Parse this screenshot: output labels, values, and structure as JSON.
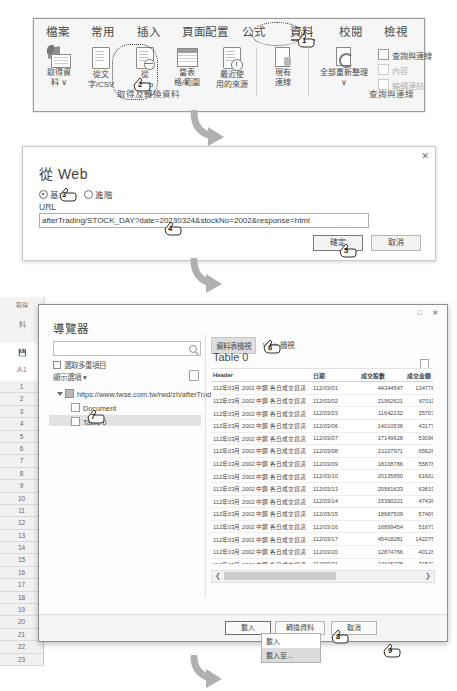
{
  "ribbon": {
    "tabs": [
      {
        "label": "檔案",
        "active": false
      },
      {
        "label": "常用",
        "active": false
      },
      {
        "label": "插入",
        "active": false
      },
      {
        "label": "頁面配置",
        "active": false
      },
      {
        "label": "公式",
        "active": false
      },
      {
        "label": "資料",
        "active": true
      },
      {
        "label": "校閱",
        "active": false
      },
      {
        "label": "檢視",
        "active": false
      }
    ],
    "groups": [
      {
        "label": "取得及轉換資料"
      },
      {
        "label": "查詢與連線"
      }
    ],
    "items": [
      {
        "name": "get-data",
        "line1": "取得資",
        "line2": "料 ∨"
      },
      {
        "name": "from-text-csv",
        "line1": "從文",
        "line2": "字/CSV"
      },
      {
        "name": "from-web",
        "line1": "從",
        "line2": "Web"
      },
      {
        "name": "from-table-range",
        "line1": "當表",
        "line2": "格/範圍"
      },
      {
        "name": "recent-sources",
        "line1": "最近使",
        "line2": "用的來源"
      },
      {
        "name": "existing-connections",
        "line1": "現有",
        "line2": "連線"
      }
    ],
    "refresh_all": {
      "line1": "全部重新整理",
      "line2": "∨"
    },
    "queries_panel": [
      {
        "label": "查詢與連線",
        "disabled": false
      },
      {
        "label": "內容",
        "disabled": true
      },
      {
        "label": "編輯連結",
        "disabled": true
      }
    ]
  },
  "from_web_dialog": {
    "title": "從 Web",
    "radio_basic": "基本",
    "radio_advanced": "進階",
    "url_label": "URL",
    "url_value": "afterTrading/STOCK_DAY?date=20230324&stockNo=2002&response=html",
    "ok_label": "確定",
    "cancel_label": "取消",
    "close_icon": "✕"
  },
  "navigator": {
    "title": "導覽器",
    "maximize_icon": "□",
    "close_icon": "✕",
    "search_placeholder": "",
    "multi_select_label": "選取多重項目",
    "display_options_label": "顯示選項 ▾",
    "tree": [
      {
        "label": "https://www.twse.com.tw/rwd/zh/afterTrading...",
        "level": 0,
        "type": "web",
        "selected": false
      },
      {
        "label": "Document",
        "level": 1,
        "type": "doc",
        "selected": false
      },
      {
        "label": "Table 0",
        "level": 1,
        "type": "table",
        "selected": true
      }
    ],
    "preview_tabs": [
      {
        "label": "資料表檢視",
        "active": true
      },
      {
        "label": "Web 檢視",
        "active": false
      }
    ],
    "preview_title": "Table 0",
    "columns": [
      "Header",
      "日期",
      "成交股數",
      "成交金額"
    ],
    "rows": [
      [
        "112年03月 2002 中鋼 各日成交資訊",
        "112/03/01",
        "44344547",
        "1347780374"
      ],
      [
        "112年03月 2002 中鋼 各日成交資訊",
        "112/03/02",
        "21962621",
        "670110553"
      ],
      [
        "112年03月 2002 中鋼 各日成交資訊",
        "112/03/03",
        "11642232",
        "357035960"
      ],
      [
        "112年03月 2002 中鋼 各日成交資訊",
        "112/03/06",
        "14010536",
        "431777660"
      ],
      [
        "112年03月 2002 中鋼 各日成交資訊",
        "112/03/07",
        "17149628",
        "530967963"
      ],
      [
        "112年03月 2002 中鋼 各日成交資訊",
        "112/03/08",
        "21107971",
        "656269971"
      ],
      [
        "112年03月 2002 中鋼 各日成交資訊",
        "112/03/09",
        "18108786",
        "558787337"
      ],
      [
        "112年03月 2002 中鋼 各日成交資訊",
        "112/03/10",
        "20135850",
        "616026295"
      ],
      [
        "112年03月 2002 中鋼 各日成交資訊",
        "112/03/13",
        "20561633",
        "636195009"
      ],
      [
        "112年03月 2002 中鋼 各日成交資訊",
        "112/03/14",
        "15390221",
        "474361288"
      ],
      [
        "112年03月 2002 中鋼 各日成交資訊",
        "112/03/15",
        "18687509",
        "574098024"
      ],
      [
        "112年03月 2002 中鋼 各日成交資訊",
        "112/03/16",
        "16899454",
        "516710278"
      ],
      [
        "112年03月 2002 中鋼 各日成交資訊",
        "112/03/17",
        "45418281",
        "1422755341"
      ],
      [
        "112年03月 2002 中鋼 各日成交資訊",
        "112/03/20",
        "12874766",
        "401284931"
      ],
      [
        "112年03月 2002 中鋼 各日成交資訊",
        "112/03/21",
        "10115278",
        "315234366"
      ],
      [
        "112年03月 2002 中鋼 各日成交資訊",
        "112/03/22",
        "12071277",
        "375930146"
      ],
      [
        "112年03月 2002 中鋼 各日成交資訊",
        "112/03/23",
        "12481157",
        "388930625"
      ],
      [
        "112年03月 2002 中鋼 各日成交資訊",
        "112/03/24",
        "15105781",
        "470072451"
      ]
    ],
    "scroll_left_icon": "❮",
    "scroll_right_icon": "❯",
    "buttons": {
      "load": "載入",
      "transform": "轉換資料",
      "cancel": "取消"
    },
    "load_menu": [
      {
        "label": "載入",
        "selected": false
      },
      {
        "label": "載入至...",
        "selected": true
      }
    ]
  },
  "excel_backdrop": {
    "name_box": "A1",
    "row_numbers": [
      "1",
      "2",
      "3",
      "4",
      "5",
      "6",
      "7",
      "8",
      "9",
      "10",
      "11",
      "12",
      "13",
      "14",
      "15",
      "16",
      "17",
      "18",
      "19",
      "20",
      "21",
      "22",
      "23"
    ],
    "side_labels": [
      "取得",
      "料"
    ]
  },
  "callouts": [
    {
      "n": "1"
    },
    {
      "n": "2"
    },
    {
      "n": "3"
    },
    {
      "n": "4"
    },
    {
      "n": "5"
    },
    {
      "n": "6"
    },
    {
      "n": "7"
    },
    {
      "n": "8"
    },
    {
      "n": "9"
    }
  ]
}
